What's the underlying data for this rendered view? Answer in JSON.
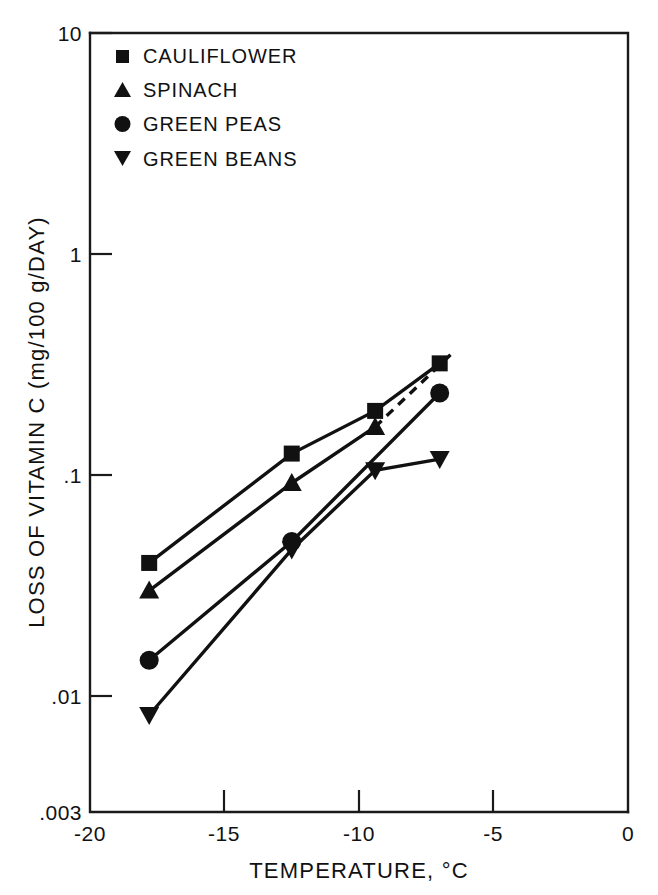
{
  "chart_data": {
    "type": "line",
    "title": "",
    "xlabel": "TEMPERATURE, °C",
    "ylabel": "LOSS OF VITAMIN C (mg/100 g/DAY)",
    "xlim": [
      -20,
      0
    ],
    "ylim": [
      0.003,
      10
    ],
    "yscale": "log",
    "xscale": "linear",
    "grid": false,
    "legend_position": "top-left",
    "xticks": [
      "-20",
      "-15",
      "-10",
      "-5",
      "0"
    ],
    "xtick_values": [
      -20,
      -15,
      -10,
      -5,
      0
    ],
    "yticks": [
      "10",
      "1",
      ".1",
      ".01",
      ".003"
    ],
    "ytick_values": [
      10,
      1,
      0.1,
      0.01,
      0.003
    ],
    "series": [
      {
        "name": "CAULIFLOWER",
        "marker": "square",
        "linestyle": "solid",
        "x": [
          -17.8,
          -12.5,
          -9.4,
          -7.0
        ],
        "y": [
          0.04,
          0.125,
          0.195,
          0.32
        ]
      },
      {
        "name": "SPINACH",
        "marker": "triangle-up",
        "linestyle": "solid",
        "x": [
          -17.8,
          -12.5,
          -9.4
        ],
        "y": [
          0.03,
          0.092,
          0.165
        ]
      },
      {
        "name": "SPINACH-EXTRAPOLATION",
        "marker": "none",
        "linestyle": "dashed",
        "x": [
          -9.4,
          -6.6
        ],
        "y": [
          0.165,
          0.35
        ]
      },
      {
        "name": "GREEN PEAS",
        "marker": "circle",
        "linestyle": "solid",
        "x": [
          -17.8,
          -12.5,
          -7.0
        ],
        "y": [
          0.0145,
          0.05,
          0.235
        ]
      },
      {
        "name": "GREEN BEANS",
        "marker": "triangle-down",
        "linestyle": "solid",
        "x": [
          -17.8,
          -12.5,
          -9.4,
          -7.0
        ],
        "y": [
          0.0082,
          0.046,
          0.105,
          0.118
        ]
      }
    ],
    "legend": [
      {
        "label": "CAULIFLOWER",
        "marker": "square"
      },
      {
        "label": "SPINACH",
        "marker": "triangle-up"
      },
      {
        "label": "GREEN PEAS",
        "marker": "circle"
      },
      {
        "label": "GREEN BEANS",
        "marker": "triangle-down"
      }
    ],
    "colors": {
      "ink": "#111111",
      "background": "#ffffff"
    }
  },
  "axes": {
    "y_title": "LOSS OF VITAMIN C (mg/100 g/DAY)",
    "x_title": "TEMPERATURE, °C",
    "y_labels": {
      "t0": "10",
      "t1": "1",
      "t2": ".1",
      "t3": ".01",
      "t4": ".003"
    },
    "x_labels": {
      "t0": "-20",
      "t1": "-15",
      "t2": "-10",
      "t3": "-5",
      "t4": "0"
    }
  },
  "legend": {
    "items": [
      {
        "label": "CAULIFLOWER"
      },
      {
        "label": "SPINACH"
      },
      {
        "label": "GREEN PEAS"
      },
      {
        "label": "GREEN BEANS"
      }
    ]
  }
}
